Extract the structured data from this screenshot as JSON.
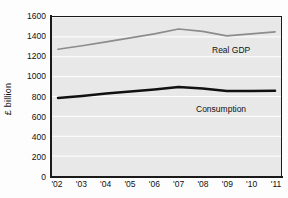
{
  "chart_data": {
    "type": "line",
    "title": "",
    "subtitle": "",
    "xlabel": "",
    "ylabel": "£ billion",
    "categories": [
      "'02",
      "'03",
      "'04",
      "'05",
      "'06",
      "'07",
      "'08",
      "'09",
      "'10",
      "'11"
    ],
    "x": [
      "'02",
      "'03",
      "'04",
      "'05",
      "'06",
      "'07",
      "'08",
      "'09",
      "'10",
      "'11"
    ],
    "ylim": [
      0,
      1600
    ],
    "yticks": [
      0,
      200,
      400,
      600,
      800,
      1000,
      1200,
      1400,
      1600
    ],
    "ytick_labels": [
      "0",
      "200",
      "400",
      "600",
      "800",
      "1000",
      "1200",
      "1400",
      "1600"
    ],
    "grid": "horizontal",
    "legend_position": "inline-right",
    "series": [
      {
        "name": "Real GDP",
        "color": "#8c8c8c",
        "line_width": 1.6,
        "values": [
          1275,
          1310,
          1350,
          1390,
          1430,
          1480,
          1455,
          1410,
          1430,
          1450
        ]
      },
      {
        "name": "Consumption",
        "color": "#111111",
        "line_width": 2.4,
        "values": [
          785,
          805,
          830,
          850,
          870,
          895,
          880,
          855,
          855,
          858
        ]
      }
    ],
    "annotations": [
      {
        "text": "Real GDP",
        "series": "Real GDP"
      },
      {
        "text": "Consumption",
        "series": "Consumption"
      }
    ]
  },
  "style": {
    "plot_background": "#e8e8e8",
    "figure_background": "#fdfdfd",
    "gridline_color": "#ffffff",
    "axis_color": "#1a1a1a",
    "text_color": "#111111"
  }
}
